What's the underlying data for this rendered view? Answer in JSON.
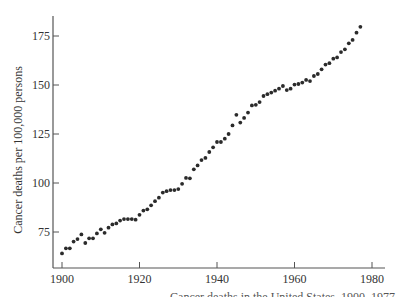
{
  "chart_data": {
    "type": "scatter",
    "title": "",
    "xlabel": "",
    "ylabel": "Cancer deaths per 100,000 persons",
    "xlim": [
      1899,
      1981
    ],
    "ylim": [
      63,
      184
    ],
    "x_ticks": [
      1900,
      1920,
      1940,
      1960,
      1980
    ],
    "x_tick_labels": [
      "1900",
      "1920",
      "1940",
      "1960",
      "1980"
    ],
    "y_ticks": [
      75,
      100,
      125,
      150,
      175
    ],
    "y_tick_labels": [
      "75",
      "100",
      "125",
      "150",
      "175"
    ],
    "grid": false,
    "legend": "none",
    "series": [
      {
        "name": "Cancer death rate",
        "x": [
          1900,
          1901,
          1902,
          1903,
          1904,
          1905,
          1906,
          1907,
          1908,
          1909,
          1910,
          1911,
          1912,
          1913,
          1914,
          1915,
          1916,
          1917,
          1918,
          1919,
          1920,
          1921,
          1922,
          1923,
          1924,
          1925,
          1926,
          1927,
          1928,
          1929,
          1930,
          1931,
          1932,
          1933,
          1934,
          1935,
          1936,
          1937,
          1938,
          1939,
          1940,
          1941,
          1942,
          1943,
          1944,
          1945,
          1946,
          1947,
          1948,
          1949,
          1950,
          1951,
          1952,
          1953,
          1954,
          1955,
          1956,
          1957,
          1958,
          1959,
          1960,
          1961,
          1962,
          1963,
          1964,
          1965,
          1966,
          1967,
          1968,
          1969,
          1970,
          1971,
          1972,
          1973,
          1974,
          1975,
          1976,
          1977
        ],
        "y": [
          64.1,
          66.7,
          66.7,
          70.1,
          71.4,
          73.8,
          69.4,
          71.8,
          71.8,
          74.3,
          76.4,
          74.6,
          77.2,
          78.9,
          79.4,
          80.8,
          81.6,
          81.6,
          81.6,
          81.3,
          83.8,
          85.9,
          86.6,
          88.6,
          90.7,
          92.5,
          95.1,
          95.8,
          96.4,
          96.4,
          96.9,
          99.6,
          102.6,
          102.4,
          107.0,
          109.0,
          111.7,
          112.8,
          115.8,
          118.2,
          120.9,
          120.9,
          122.6,
          125.0,
          129.4,
          134.8,
          130.8,
          133.2,
          135.9,
          139.6,
          139.9,
          141.3,
          144.4,
          145.3,
          146.1,
          147.1,
          148.1,
          149.5,
          147.4,
          148.1,
          150.2,
          150.5,
          151.2,
          152.6,
          152.0,
          154.6,
          155.6,
          158.0,
          160.4,
          161.1,
          163.4,
          164.1,
          166.8,
          168.2,
          171.3,
          173.0,
          176.7,
          179.7
        ]
      }
    ],
    "colors": {
      "points": "#2b2b2b",
      "axis": "#555555"
    }
  },
  "caption": "Cancer deaths in the United States, 1900–1977"
}
